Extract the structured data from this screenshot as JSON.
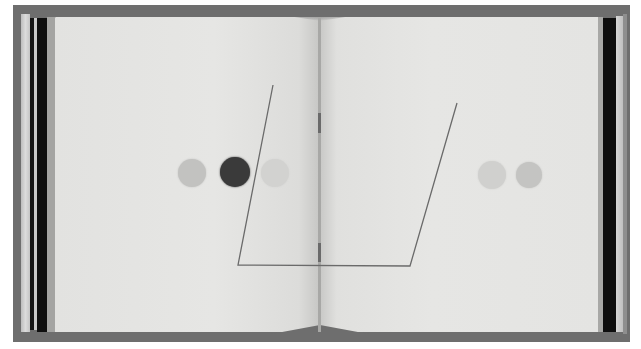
{
  "scene": {
    "subject": "open artist's book photographed flat",
    "background_color": "#ffffff",
    "frame_color": "#6e6e6e",
    "page_color": "#e4e4e2"
  },
  "left_page": {
    "circles": [
      {
        "cx": 192,
        "cy": 173,
        "r": 14,
        "color": "#c2c2c0"
      },
      {
        "cx": 235,
        "cy": 172,
        "r": 15,
        "color": "#3a3a3a"
      },
      {
        "cx": 275,
        "cy": 173,
        "r": 14,
        "color": "#d2d2d0"
      }
    ]
  },
  "right_page": {
    "circles": [
      {
        "cx": 492,
        "cy": 175,
        "r": 14,
        "color": "#d0d0ce"
      },
      {
        "cx": 529,
        "cy": 175,
        "r": 13,
        "color": "#c4c4c2"
      }
    ]
  },
  "drawn_line": {
    "points": [
      [
        273,
        85
      ],
      [
        238,
        265
      ],
      [
        410,
        266
      ],
      [
        457,
        103
      ]
    ],
    "color": "#6a6a6a",
    "width": 1.3
  },
  "binding": {
    "threads": [
      {
        "top": 113,
        "height": 20
      },
      {
        "top": 243,
        "height": 19
      }
    ]
  }
}
